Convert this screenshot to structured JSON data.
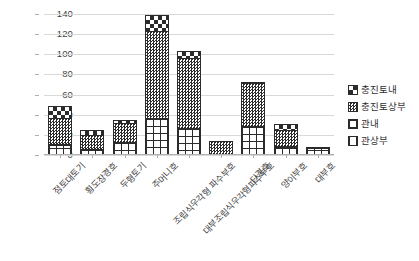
{
  "chart_data": {
    "type": "bar",
    "stacked": true,
    "title": "",
    "subtitle": "",
    "xlabel": "",
    "ylabel": "",
    "ylim": [
      0,
      140
    ],
    "ytick_step": 20,
    "yticks": [
      "140",
      "120",
      "100",
      "80",
      "60",
      "40",
      "20",
      "0"
    ],
    "grid": true,
    "legend_position": "right",
    "categories": [
      "점토대토기",
      "횡도장경호",
      "두형토기",
      "주머니호",
      "조립식우각형 파수부호",
      "대부조립식우각형파수부호",
      "단경호",
      "양이부호",
      "대부호"
    ],
    "series": [
      {
        "name": "관상부",
        "pattern": "pat-gwansangbu",
        "values": [
          5,
          0,
          0,
          0,
          0,
          0,
          5,
          5,
          3
        ]
      },
      {
        "name": "관내",
        "pattern": "pat-gwannae",
        "values": [
          4,
          4,
          11,
          35,
          25,
          0,
          22,
          2,
          3
        ]
      },
      {
        "name": "충진토상부",
        "pattern": "pat-chungjinto-sangbu",
        "values": [
          26,
          14,
          19,
          86,
          69,
          12,
          43,
          16,
          0
        ]
      },
      {
        "name": "충진토내",
        "pattern": "pat-chungjinto-nae",
        "values": [
          12,
          5,
          3,
          16,
          7,
          0,
          1,
          6,
          0
        ]
      }
    ],
    "totals": [
      47,
      23,
      33,
      137,
      101,
      12,
      71,
      29,
      6
    ]
  },
  "legend": {
    "items": [
      {
        "label": "충진토내",
        "pattern": "pat-chungjinto-nae"
      },
      {
        "label": "충진토상부",
        "pattern": "pat-chungjinto-sangbu"
      },
      {
        "label": "관내",
        "pattern": "pat-gwannae"
      },
      {
        "label": "관상부",
        "pattern": "pat-gwansangbu"
      }
    ]
  },
  "colors": {
    "ink": "#2b2b2b",
    "grid": "#d9d9d9",
    "axis": "#b0b0b0",
    "background": "#ffffff",
    "text": "#3f3f3f"
  }
}
